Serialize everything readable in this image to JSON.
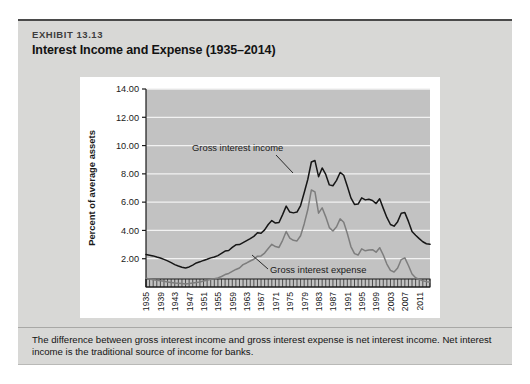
{
  "exhibit": {
    "label": "EXHIBIT 13.13",
    "title": "Interest Income and Expense (1935–2014)"
  },
  "caption": "The difference between gross interest income and gross interest expense is net interest income. Net interest income is the traditional source of income for banks.",
  "colors": {
    "panel_background": "#d8d8d6",
    "plot_background": "#c2c2c2",
    "card_background": "#ffffff",
    "gridline": "#f2f2f2",
    "income_line": "#161616",
    "expense_line": "#7d7d7d",
    "axis": "#1a1a1a"
  },
  "chart_data": {
    "type": "line",
    "title": "Interest Income and Expense (1935–2014)",
    "xlabel": "",
    "ylabel": "Percent of average assets",
    "ylim": [
      0,
      14
    ],
    "yticks": [
      2.0,
      4.0,
      6.0,
      8.0,
      10.0,
      12.0,
      14.0
    ],
    "ytick_labels": [
      "2.00",
      "4.00",
      "6.00",
      "8.00",
      "10.00",
      "12.00",
      "14.00"
    ],
    "ytick_format": "0.00",
    "xlim": [
      1935,
      2014
    ],
    "xticks": [
      1935,
      1939,
      1943,
      1947,
      1951,
      1955,
      1959,
      1963,
      1967,
      1971,
      1975,
      1979,
      1983,
      1987,
      1991,
      1995,
      1999,
      2003,
      2007,
      2011
    ],
    "xtick_labels": [
      "1935",
      "1939",
      "1943",
      "1947",
      "1951",
      "1955",
      "1959",
      "1963",
      "1967",
      "1971",
      "1975",
      "1979",
      "1983",
      "1987",
      "1991",
      "1995",
      "1999",
      "2003",
      "2007",
      "2011"
    ],
    "xtick_rotation": 90,
    "grid": "horizontal",
    "legend_position": "inline-annotations",
    "annotations": [
      {
        "text": "Gross interest income",
        "series": "Gross interest income",
        "x": 1972,
        "y": 9.2
      },
      {
        "text": "Gross interest expense",
        "series": "Gross interest expense",
        "x": 1991,
        "y": 1.0
      }
    ],
    "x": [
      1935,
      1936,
      1937,
      1938,
      1939,
      1940,
      1941,
      1942,
      1943,
      1944,
      1945,
      1946,
      1947,
      1948,
      1949,
      1950,
      1951,
      1952,
      1953,
      1954,
      1955,
      1956,
      1957,
      1958,
      1959,
      1960,
      1961,
      1962,
      1963,
      1964,
      1965,
      1966,
      1967,
      1968,
      1969,
      1970,
      1971,
      1972,
      1973,
      1974,
      1975,
      1976,
      1977,
      1978,
      1979,
      1980,
      1981,
      1982,
      1983,
      1984,
      1985,
      1986,
      1987,
      1988,
      1989,
      1990,
      1991,
      1992,
      1993,
      1994,
      1995,
      1996,
      1997,
      1998,
      1999,
      2000,
      2001,
      2002,
      2003,
      2004,
      2005,
      2006,
      2007,
      2008,
      2009,
      2010,
      2011,
      2012,
      2013,
      2014
    ],
    "series": [
      {
        "name": "Gross interest income",
        "color": "#161616",
        "values": [
          2.3,
          2.25,
          2.2,
          2.12,
          2.05,
          1.95,
          1.85,
          1.72,
          1.58,
          1.48,
          1.4,
          1.35,
          1.42,
          1.55,
          1.7,
          1.78,
          1.88,
          1.96,
          2.06,
          2.12,
          2.22,
          2.38,
          2.54,
          2.58,
          2.8,
          2.98,
          3.0,
          3.14,
          3.28,
          3.42,
          3.58,
          3.84,
          3.8,
          4.04,
          4.42,
          4.7,
          4.52,
          4.56,
          5.12,
          5.72,
          5.3,
          5.24,
          5.3,
          5.76,
          6.66,
          7.6,
          8.84,
          8.94,
          7.8,
          8.42,
          7.96,
          7.22,
          7.16,
          7.54,
          8.1,
          7.9,
          7.12,
          6.3,
          5.84,
          5.86,
          6.3,
          6.16,
          6.2,
          6.12,
          5.9,
          6.24,
          5.56,
          4.92,
          4.42,
          4.3,
          4.62,
          5.22,
          5.26,
          4.64,
          3.92,
          3.66,
          3.42,
          3.2,
          3.06,
          3.02
        ]
      },
      {
        "name": "Gross interest expense",
        "color": "#7d7d7d",
        "values": [
          0.62,
          0.56,
          0.52,
          0.48,
          0.44,
          0.4,
          0.36,
          0.32,
          0.28,
          0.26,
          0.24,
          0.22,
          0.24,
          0.28,
          0.32,
          0.36,
          0.42,
          0.48,
          0.54,
          0.58,
          0.64,
          0.74,
          0.88,
          0.96,
          1.1,
          1.24,
          1.34,
          1.58,
          1.7,
          1.84,
          1.96,
          2.18,
          2.2,
          2.4,
          2.72,
          3.02,
          2.86,
          2.8,
          3.3,
          3.92,
          3.46,
          3.3,
          3.26,
          3.62,
          4.46,
          5.46,
          6.86,
          6.72,
          5.22,
          5.6,
          4.96,
          4.2,
          3.96,
          4.26,
          4.82,
          4.58,
          3.78,
          2.86,
          2.36,
          2.26,
          2.7,
          2.56,
          2.62,
          2.64,
          2.46,
          2.78,
          2.26,
          1.62,
          1.18,
          1.06,
          1.34,
          1.94,
          2.06,
          1.52,
          0.92,
          0.66,
          0.54,
          0.44,
          0.38,
          0.36
        ]
      }
    ]
  }
}
